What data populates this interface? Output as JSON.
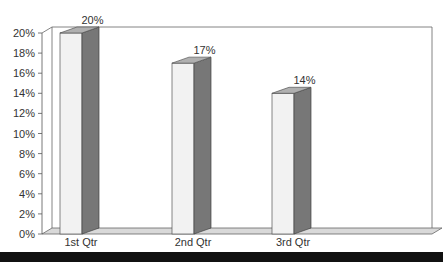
{
  "chart_data": {
    "type": "bar",
    "style": "3d-column",
    "title": "",
    "xlabel": "",
    "ylabel": "",
    "categories": [
      "1st Qtr",
      "2nd Qtr",
      "3rd Qtr"
    ],
    "values": [
      20,
      17,
      14
    ],
    "data_labels": [
      "20%",
      "17%",
      "14%"
    ],
    "ylim": [
      0,
      20
    ],
    "y_ticks": [
      "0%",
      "2%",
      "4%",
      "6%",
      "8%",
      "10%",
      "12%",
      "14%",
      "16%",
      "18%",
      "20%"
    ],
    "grid": false,
    "legend": null
  },
  "colors": {
    "bar_front": "#f2f2f2",
    "bar_side": "#777777",
    "bar_top": "#b0b0b0",
    "floor": "#d9d9d9",
    "axis": "#555555",
    "bottom_bar": "#111111"
  }
}
